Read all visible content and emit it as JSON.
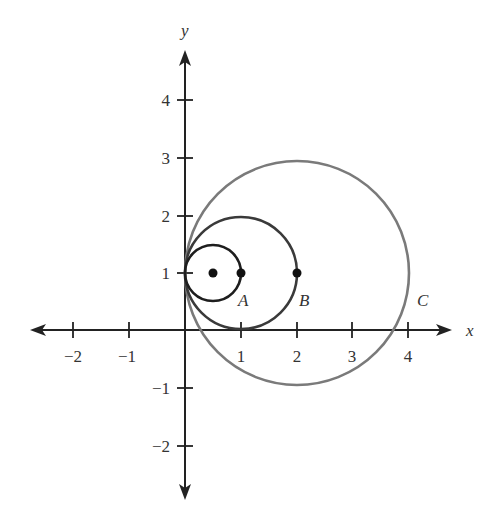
{
  "diagram": {
    "axes": {
      "x_label": "x",
      "y_label": "y",
      "x_ticks": [
        {
          "value": -2,
          "label": "−2"
        },
        {
          "value": -1,
          "label": "−1"
        },
        {
          "value": 1,
          "label": "1"
        },
        {
          "value": 2,
          "label": "2"
        },
        {
          "value": 3,
          "label": "3"
        },
        {
          "value": 4,
          "label": "4"
        }
      ],
      "y_ticks": [
        {
          "value": 4,
          "label": "4"
        },
        {
          "value": 3,
          "label": "3"
        },
        {
          "value": 2,
          "label": "2"
        },
        {
          "value": 1,
          "label": "1"
        },
        {
          "value": -1,
          "label": "−1"
        },
        {
          "value": -2,
          "label": "−2"
        }
      ]
    },
    "circles": [
      {
        "name": "small",
        "center": [
          0.5,
          1
        ],
        "radius": 0.5,
        "color": "#222222"
      },
      {
        "name": "medium",
        "center": [
          1,
          1
        ],
        "radius": 1,
        "color": "#333333"
      },
      {
        "name": "large",
        "center": [
          2,
          1
        ],
        "radius": 2,
        "color": "#777777"
      }
    ],
    "points": [
      {
        "coords": [
          0.5,
          1
        ],
        "label": ""
      },
      {
        "coords": [
          1,
          1
        ],
        "label": "A"
      },
      {
        "coords": [
          2,
          1
        ],
        "label": "B"
      }
    ],
    "labels": {
      "A": "A",
      "B": "B",
      "C": "C"
    }
  }
}
